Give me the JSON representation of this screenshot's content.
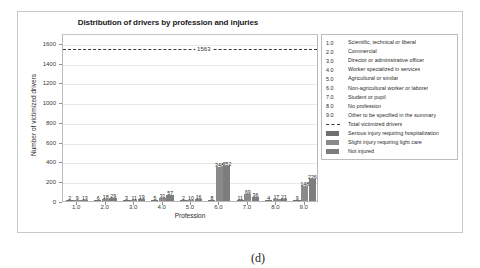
{
  "figure": {
    "caption": "(d)"
  },
  "chart_data": {
    "type": "bar",
    "title": "Distribution of drivers by profession and injuries",
    "xlabel": "Profession",
    "ylabel": "Number of victimized drivers",
    "categories": [
      "1.0",
      "2.0",
      "3.0",
      "4.0",
      "5.0",
      "6.0",
      "7.0",
      "8.0",
      "9.0"
    ],
    "ylim": [
      0,
      1700
    ],
    "yticks": [
      0,
      200,
      400,
      600,
      800,
      1000,
      1200,
      1400,
      1600
    ],
    "grid": true,
    "legend_position": "right-outside",
    "series": [
      {
        "name": "Serious injury requiring hospitalization",
        "color": "#6f6f6f",
        "values": [
          2,
          6,
          3,
          5,
          2,
          8,
          11,
          4,
          9
        ]
      },
      {
        "name": "Slight injury requiring light care",
        "color": "#8a8a8a",
        "values": [
          9,
          18,
          11,
          31,
          10,
          348,
          69,
          17,
          148
        ]
      },
      {
        "name": "Not injured",
        "color": "#7d7d7d",
        "values": [
          13,
          29,
          19,
          57,
          16,
          352,
          36,
          21,
          226
        ]
      }
    ],
    "bar_labels": [
      [
        "2",
        "9",
        "13"
      ],
      [
        "6",
        "18",
        "29"
      ],
      [
        "3",
        "11",
        "19"
      ],
      [
        "5",
        "31",
        "57"
      ],
      [
        "2",
        "10",
        "16"
      ],
      [
        "8",
        "348",
        "352"
      ],
      [
        "11",
        "69",
        "36"
      ],
      [
        "4",
        "17",
        "21"
      ],
      [
        "9",
        "148",
        "226"
      ]
    ],
    "reference_line": {
      "label": "1563",
      "value": 1563,
      "style": "dashed",
      "name": "Total victimized drivers"
    },
    "legend_codes": [
      {
        "code": "1.0",
        "label": "Scientific, technical or liberal"
      },
      {
        "code": "2.0",
        "label": "Commercial"
      },
      {
        "code": "3.0",
        "label": "Director or administrative officer"
      },
      {
        "code": "4.0",
        "label": "Worker specialized in services"
      },
      {
        "code": "5.0",
        "label": "Agricultural or similar"
      },
      {
        "code": "6.0",
        "label": "Non-agricultural worker or laborer"
      },
      {
        "code": "7.0",
        "label": "Student or pupil"
      },
      {
        "code": "8.0",
        "label": "No profession"
      },
      {
        "code": "9.0",
        "label": "Other to be specified in the summary"
      }
    ],
    "legend_series": [
      {
        "key": "dashed",
        "label": "Total victimized drivers"
      },
      {
        "key": "swatch0",
        "label": "Serious injury requiring hospitalization"
      },
      {
        "key": "swatch1",
        "label": "Slight injury requiring light care"
      },
      {
        "key": "swatch2",
        "label": "Not injured"
      }
    ]
  }
}
